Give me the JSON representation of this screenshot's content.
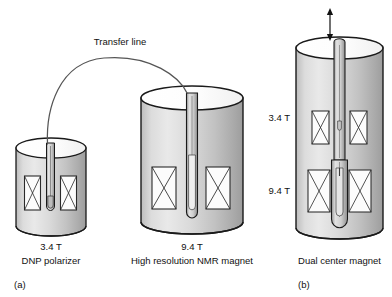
{
  "figure": {
    "title": "",
    "panels": [
      {
        "tag": "(a)",
        "components": [
          {
            "name": "dnp-polarizer",
            "field_label": "3.4 T",
            "caption": "DNP polarizer",
            "coils": 2
          },
          {
            "name": "high-resolution-nmr-magnet",
            "field_label": "9.4 T",
            "caption": "High resolution NMR magnet",
            "coils": 2
          }
        ],
        "connector": {
          "name": "transfer-line",
          "label": "Transfer line"
        }
      },
      {
        "tag": "(b)",
        "components": [
          {
            "name": "dual-center-magnet",
            "caption": "Dual center magnet",
            "field_label_upper": "3.4 T",
            "field_label_lower": "9.4 T",
            "coils": 4,
            "arrow": "double-headed-vertical-arrow"
          }
        ]
      }
    ]
  },
  "labels": {
    "transfer_line": "Transfer line",
    "left_field": "3.4 T",
    "left_caption": "DNP polarizer",
    "mid_field": "9.4 T",
    "mid_caption": "High resolution NMR magnet",
    "right_field_upper": "3.4 T",
    "right_field_lower": "9.4 T",
    "right_caption": "Dual center magnet",
    "panel_a": "(a)",
    "panel_b": "(b)"
  },
  "colors": {
    "background": "#ffffff",
    "outline": "#1a1a1a",
    "cylinder_light": "#e8e8e8",
    "cylinder_mid": "#cccccc",
    "cylinder_dark": "#a8a8a8",
    "top_fill": "#fbfbfb",
    "coil_fill": "#fcfcfc",
    "tube_fill": "#d6d6d6",
    "text": "#111111"
  }
}
